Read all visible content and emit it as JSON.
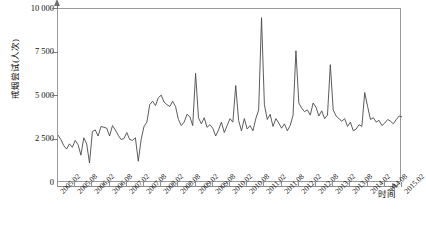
{
  "chart_data": {
    "type": "line",
    "title": "",
    "xlabel": "时间",
    "ylabel": "戒烟尝试(人次)",
    "ylim": [
      0,
      10000
    ],
    "yticks": [
      0,
      2500,
      5000,
      7500,
      10000
    ],
    "ytick_labels": [
      "0",
      "2 500",
      "5 000",
      "7 500",
      "10 000"
    ],
    "grid": false,
    "legend": null,
    "line_color": "#4a4a4a",
    "xtick_labels": [
      "2005.02",
      "2005.08",
      "2006.02",
      "2006.08",
      "2007.02",
      "2007.08",
      "2008.02",
      "2008.08",
      "2009.02",
      "2009.08",
      "2010.02",
      "2010.08",
      "2011.02",
      "2011.08",
      "2012.02",
      "2012.08",
      "2013.02",
      "2013.08",
      "2014.02",
      "2014.08",
      "2015.02"
    ],
    "x_start": "2005.02",
    "x_end": "2015.02",
    "x_interval_months": 1,
    "x": [
      "2005.02",
      "2005.03",
      "2005.04",
      "2005.05",
      "2005.06",
      "2005.07",
      "2005.08",
      "2005.09",
      "2005.10",
      "2005.11",
      "2005.12",
      "2006.01",
      "2006.02",
      "2006.03",
      "2006.04",
      "2006.05",
      "2006.06",
      "2006.07",
      "2006.08",
      "2006.09",
      "2006.10",
      "2006.11",
      "2006.12",
      "2007.01",
      "2007.02",
      "2007.03",
      "2007.04",
      "2007.05",
      "2007.06",
      "2007.07",
      "2007.08",
      "2007.09",
      "2007.10",
      "2007.11",
      "2007.12",
      "2008.01",
      "2008.02",
      "2008.03",
      "2008.04",
      "2008.05",
      "2008.06",
      "2008.07",
      "2008.08",
      "2008.09",
      "2008.10",
      "2008.11",
      "2008.12",
      "2009.01",
      "2009.02",
      "2009.03",
      "2009.04",
      "2009.05",
      "2009.06",
      "2009.07",
      "2009.08",
      "2009.09",
      "2009.10",
      "2009.11",
      "2009.12",
      "2010.01",
      "2010.02",
      "2010.03",
      "2010.04",
      "2010.05",
      "2010.06",
      "2010.07",
      "2010.08",
      "2010.09",
      "2010.10",
      "2010.11",
      "2010.12",
      "2011.01",
      "2011.02",
      "2011.03",
      "2011.04",
      "2011.05",
      "2011.06",
      "2011.07",
      "2011.08",
      "2011.09",
      "2011.10",
      "2011.11",
      "2011.12",
      "2012.01",
      "2012.02",
      "2012.03",
      "2012.04",
      "2012.05",
      "2012.06",
      "2012.07",
      "2012.08",
      "2012.09",
      "2012.10",
      "2012.11",
      "2012.12",
      "2013.01",
      "2013.02",
      "2013.03",
      "2013.04",
      "2013.05",
      "2013.06",
      "2013.07",
      "2013.08",
      "2013.09",
      "2013.10",
      "2013.11",
      "2013.12",
      "2014.01",
      "2014.02",
      "2014.03",
      "2014.04",
      "2014.05",
      "2014.06",
      "2014.07",
      "2014.08",
      "2014.09",
      "2014.10",
      "2014.11",
      "2014.12",
      "2015.01",
      "2015.02"
    ],
    "values": [
      2750,
      2500,
      2150,
      1950,
      2250,
      2050,
      2450,
      2200,
      1600,
      2600,
      2250,
      1150,
      2950,
      3050,
      2700,
      3250,
      3200,
      3150,
      2700,
      3300,
      3050,
      2750,
      2500,
      2550,
      2900,
      2500,
      2450,
      2600,
      1250,
      2500,
      3250,
      3500,
      4500,
      4700,
      4450,
      4900,
      5050,
      4650,
      4500,
      4400,
      4700,
      4400,
      3650,
      3300,
      3500,
      3950,
      3800,
      3300,
      6300,
      3750,
      3400,
      3750,
      3200,
      3350,
      3150,
      2700,
      3050,
      3500,
      2900,
      3300,
      3700,
      3500,
      5600,
      3600,
      3000,
      3700,
      3100,
      3300,
      3000,
      3700,
      4200,
      9500,
      4500,
      3650,
      3950,
      3250,
      3700,
      3450,
      3150,
      3400,
      3000,
      3300,
      3900,
      7600,
      4600,
      4300,
      4100,
      4200,
      3900,
      4600,
      4350,
      3850,
      4150,
      3700,
      3900,
      6800,
      4200,
      3850,
      3700,
      3550,
      3700,
      3250,
      3500,
      3000,
      3100,
      3350,
      3250,
      5200,
      4400,
      3650,
      3750,
      3500,
      3600,
      3300,
      3450,
      3650,
      3550,
      3400,
      3650,
      3850,
      3800
    ]
  }
}
